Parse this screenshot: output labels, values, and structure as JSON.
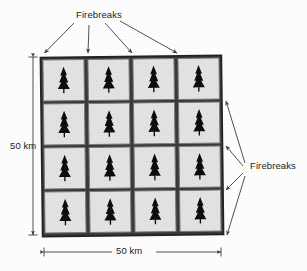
{
  "figure": {
    "kind": "forest-firebreak-grid-diagram",
    "background_color": "#fdfdfd",
    "labels": {
      "firebreaks_top": "Firebreaks",
      "firebreaks_right": "Firebreaks",
      "height": "50 km",
      "width": "50 km"
    }
  },
  "grid": {
    "rows": 4,
    "cols": 4,
    "cell_count": 16,
    "cell_fill": "#e2e2e2",
    "cell_stroke": "#7d7d7d",
    "firebreak_color": "#2b2b2b",
    "tree_color": "#0d0d0d",
    "icon": "conifer-tree-icon",
    "cells": [
      {
        "row": 1,
        "col": 1,
        "icon": "conifer-tree-icon"
      },
      {
        "row": 1,
        "col": 2,
        "icon": "conifer-tree-icon"
      },
      {
        "row": 1,
        "col": 3,
        "icon": "conifer-tree-icon"
      },
      {
        "row": 1,
        "col": 4,
        "icon": "conifer-tree-icon"
      },
      {
        "row": 2,
        "col": 1,
        "icon": "conifer-tree-icon"
      },
      {
        "row": 2,
        "col": 2,
        "icon": "conifer-tree-icon"
      },
      {
        "row": 2,
        "col": 3,
        "icon": "conifer-tree-icon"
      },
      {
        "row": 2,
        "col": 4,
        "icon": "conifer-tree-icon"
      },
      {
        "row": 3,
        "col": 1,
        "icon": "conifer-tree-icon"
      },
      {
        "row": 3,
        "col": 2,
        "icon": "conifer-tree-icon"
      },
      {
        "row": 3,
        "col": 3,
        "icon": "conifer-tree-icon"
      },
      {
        "row": 3,
        "col": 4,
        "icon": "conifer-tree-icon"
      },
      {
        "row": 4,
        "col": 1,
        "icon": "conifer-tree-icon"
      },
      {
        "row": 4,
        "col": 2,
        "icon": "conifer-tree-icon"
      },
      {
        "row": 4,
        "col": 3,
        "icon": "conifer-tree-icon"
      },
      {
        "row": 4,
        "col": 4,
        "icon": "conifer-tree-icon"
      }
    ]
  },
  "annotations": {
    "top_arrow_count": 4,
    "right_arrow_count": 4,
    "dimension_arrows": [
      "vertical-50km",
      "horizontal-50km"
    ],
    "leader_color": "#4a4a4a"
  }
}
